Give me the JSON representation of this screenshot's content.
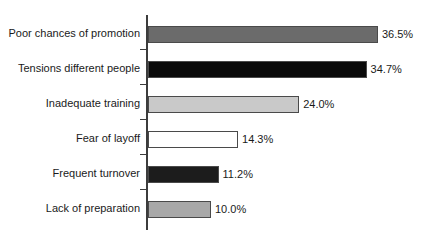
{
  "chart_data": {
    "type": "bar",
    "orientation": "horizontal",
    "title": "",
    "subtitle": "",
    "xlabel": "",
    "ylabel": "",
    "xlim": [
      0,
      40
    ],
    "grid": false,
    "legend": false,
    "categories": [
      "Poor chances of promotion",
      "Tensions different people",
      "Inadequate training",
      "Fear of layoff",
      "Frequent turnover",
      "Lack of preparation"
    ],
    "values": [
      36.5,
      34.7,
      24.0,
      14.3,
      11.2,
      10.0
    ],
    "value_labels": [
      "36.5%",
      "34.7%",
      "24.0%",
      "14.3%",
      "11.2%",
      "10.0%"
    ],
    "bar_fills": [
      "#6b6b6b",
      "#0a0a0a",
      "#c9c9c9",
      "#ffffff",
      "#1c1c1c",
      "#a8a8a8"
    ],
    "bar_stroke": "#4a4a4a",
    "axis_color": "#3c3c3c",
    "background": "#ffffff",
    "text_color": "#1a1a1a"
  },
  "bars": [
    {
      "label": "Poor chances of promotion",
      "value": 36.5,
      "value_label": "36.5%",
      "fill": "#6b6b6b"
    },
    {
      "label": "Tensions different people",
      "value": 34.7,
      "value_label": "34.7%",
      "fill": "#0a0a0a"
    },
    {
      "label": "Inadequate training",
      "value": 24.0,
      "value_label": "24.0%",
      "fill": "#c9c9c9"
    },
    {
      "label": "Fear of layoff",
      "value": 14.3,
      "value_label": "14.3%",
      "fill": "#ffffff"
    },
    {
      "label": "Frequent turnover",
      "value": 11.2,
      "value_label": "11.2%",
      "fill": "#1c1c1c"
    },
    {
      "label": "Lack of preparation",
      "value": 10.0,
      "value_label": "10.0%",
      "fill": "#a8a8a8"
    }
  ]
}
